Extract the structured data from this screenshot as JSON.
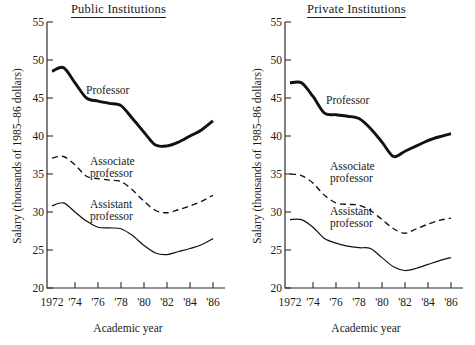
{
  "figure": {
    "axis_label_x": "Academic year",
    "axis_label_y": "Salary (thousands of 1985–86 dollars)",
    "y_ticks": [
      "20",
      "25",
      "30",
      "35",
      "40",
      "45",
      "50",
      "55"
    ],
    "x_ticks": [
      "1972",
      "'74",
      "'76",
      "'78",
      "'80",
      "'82",
      "'84",
      "'86"
    ],
    "series_labels": {
      "professor": "Professor",
      "associate_line1": "Associate",
      "associate_line2": "professor",
      "assistant_line1": "Assistant",
      "assistant_line2": "professor"
    }
  },
  "panels": [
    {
      "id": "public",
      "title": "Public Institutions"
    },
    {
      "id": "private",
      "title": "Private Institutions"
    }
  ],
  "chart_data": [
    {
      "type": "line",
      "title": "Public Institutions",
      "xlabel": "Academic year",
      "ylabel": "Salary (thousands of 1985-86 dollars)",
      "ylim": [
        20,
        55
      ],
      "xlim": [
        1972,
        1986
      ],
      "grid": false,
      "legend": "inline annotations",
      "x": [
        1972,
        1973,
        1974,
        1975,
        1976,
        1977,
        1978,
        1979,
        1980,
        1981,
        1982,
        1983,
        1984,
        1985,
        1986
      ],
      "series": [
        {
          "name": "Professor",
          "style": "thick solid",
          "values": [
            48.5,
            49.0,
            47.0,
            45.0,
            44.6,
            44.3,
            44.0,
            42.3,
            40.5,
            38.8,
            38.7,
            39.2,
            40.0,
            40.8,
            42.0
          ]
        },
        {
          "name": "Associate professor",
          "style": "dashed",
          "values": [
            37.1,
            37.3,
            36.2,
            34.7,
            34.4,
            34.2,
            34.0,
            32.9,
            31.4,
            30.2,
            29.9,
            30.3,
            30.8,
            31.4,
            32.2
          ]
        },
        {
          "name": "Assistant professor",
          "style": "thin solid",
          "values": [
            30.8,
            31.2,
            30.0,
            28.8,
            28.0,
            27.9,
            27.8,
            26.9,
            25.6,
            24.6,
            24.4,
            24.8,
            25.2,
            25.7,
            26.5
          ]
        }
      ]
    },
    {
      "type": "line",
      "title": "Private Institutions",
      "xlabel": "Academic year",
      "ylabel": "Salary (thousands of 1985-86 dollars)",
      "ylim": [
        20,
        55
      ],
      "xlim": [
        1972,
        1986
      ],
      "grid": false,
      "legend": "inline annotations",
      "x": [
        1972,
        1973,
        1974,
        1975,
        1976,
        1977,
        1978,
        1979,
        1980,
        1981,
        1982,
        1983,
        1984,
        1985,
        1986
      ],
      "series": [
        {
          "name": "Professor",
          "style": "thick solid",
          "values": [
            47.0,
            47.0,
            45.2,
            43.0,
            42.8,
            42.6,
            42.3,
            41.0,
            39.2,
            37.3,
            38.0,
            38.7,
            39.4,
            39.9,
            40.3
          ]
        },
        {
          "name": "Associate professor",
          "style": "dashed",
          "values": [
            35.0,
            34.8,
            33.8,
            32.2,
            31.2,
            31.0,
            30.9,
            30.2,
            29.0,
            27.8,
            27.2,
            27.8,
            28.4,
            28.9,
            29.2
          ]
        },
        {
          "name": "Assistant professor",
          "style": "thin solid",
          "values": [
            29.0,
            29.0,
            28.0,
            26.5,
            25.9,
            25.5,
            25.3,
            25.2,
            24.0,
            22.8,
            22.3,
            22.6,
            23.1,
            23.6,
            24.0
          ]
        }
      ]
    }
  ]
}
